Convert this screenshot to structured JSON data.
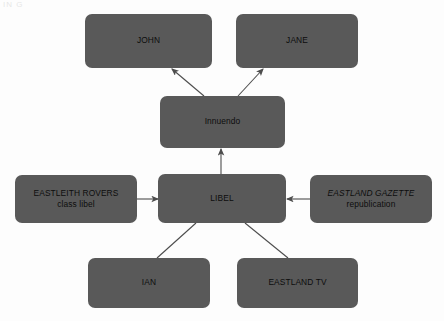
{
  "diagram": {
    "background_color": "#fdfdfd",
    "node_fill_color": "#595959",
    "node_text_color": "#0d0d0d",
    "edge_color": "#4d4d4d",
    "corner_artifact_text": "IN G",
    "nodes": [
      {
        "id": "john",
        "line1": "JOHN",
        "line2": "",
        "x": 85,
        "y": 14,
        "w": 127,
        "h": 54
      },
      {
        "id": "jane",
        "line1": "JANE",
        "line2": "",
        "x": 236,
        "y": 14,
        "w": 122,
        "h": 54
      },
      {
        "id": "innuendo",
        "line1": "Innuendo",
        "line2": "",
        "x": 160,
        "y": 96,
        "w": 125,
        "h": 52
      },
      {
        "id": "eastleith-rovers",
        "line1": "EASTLEITH ROVERS",
        "line2": "class libel",
        "x": 15,
        "y": 175,
        "w": 122,
        "h": 48
      },
      {
        "id": "libel",
        "line1": "LIBEL",
        "line2": "",
        "x": 158,
        "y": 174,
        "w": 128,
        "h": 49
      },
      {
        "id": "eastland-gazette",
        "line1": "EASTLAND GAZETTE",
        "line2": "republication",
        "x": 310,
        "y": 175,
        "w": 122,
        "h": 48
      },
      {
        "id": "ian",
        "line1": "IAN",
        "line2": "",
        "x": 88,
        "y": 258,
        "w": 122,
        "h": 50
      },
      {
        "id": "eastland-tv",
        "line1": "EASTLAND TV",
        "line2": "",
        "x": 237,
        "y": 258,
        "w": 121,
        "h": 50
      }
    ],
    "edges": [
      {
        "id": "innuendo-to-john",
        "from": "innuendo",
        "to": "john",
        "x1": 204,
        "y1": 96,
        "x2": 172,
        "y2": 69,
        "arrow": true
      },
      {
        "id": "innuendo-to-jane",
        "from": "innuendo",
        "to": "jane",
        "x1": 238,
        "y1": 96,
        "x2": 263,
        "y2": 69,
        "arrow": true
      },
      {
        "id": "libel-to-innuendo",
        "from": "libel",
        "to": "innuendo",
        "x1": 221,
        "y1": 174,
        "x2": 221,
        "y2": 149,
        "arrow": true
      },
      {
        "id": "eastleith-rovers-to-libel",
        "from": "eastleith-rovers",
        "to": "libel",
        "x1": 137,
        "y1": 199,
        "x2": 158,
        "y2": 199,
        "arrow": true
      },
      {
        "id": "eastland-gazette-to-libel",
        "from": "eastland-gazette",
        "to": "libel",
        "x1": 310,
        "y1": 199,
        "x2": 287,
        "y2": 199,
        "arrow": true
      },
      {
        "id": "ian-to-libel",
        "from": "ian",
        "to": "libel",
        "x1": 157,
        "y1": 258,
        "x2": 196,
        "y2": 223,
        "arrow": false
      },
      {
        "id": "eastland-tv-to-libel",
        "from": "eastland-tv",
        "to": "libel",
        "x1": 288,
        "y1": 258,
        "x2": 245,
        "y2": 223,
        "arrow": false
      }
    ]
  }
}
